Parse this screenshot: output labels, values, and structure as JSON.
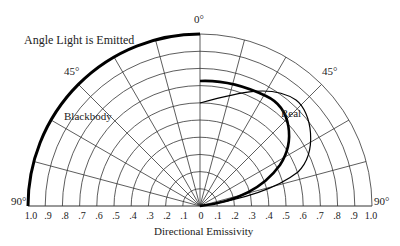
{
  "diagram": {
    "title_label": "Angle Light is Emitted",
    "axis_label": "Directional Emissivity",
    "angle_labels": {
      "top": "0°",
      "left45": "45°",
      "right45": "45°",
      "left90": "90°",
      "right90": "90°"
    },
    "curve_labels": {
      "blackbody": "Blackbody",
      "real": "Real"
    },
    "ticks_left": [
      "1.0",
      ".9",
      ".8",
      ".7",
      ".6",
      ".5",
      ".4",
      ".3",
      ".2",
      ".1"
    ],
    "tick_center": "0",
    "ticks_right": [
      ".1",
      ".2",
      ".3",
      ".4",
      ".5",
      ".6",
      ".7",
      ".8",
      ".9",
      "1.0"
    ],
    "grid": {
      "ring_step": 0.1,
      "rings": 10,
      "spoke_step_deg": 15
    },
    "colors": {
      "line": "#111111",
      "grid": "#333333",
      "background": "#ffffff"
    }
  }
}
